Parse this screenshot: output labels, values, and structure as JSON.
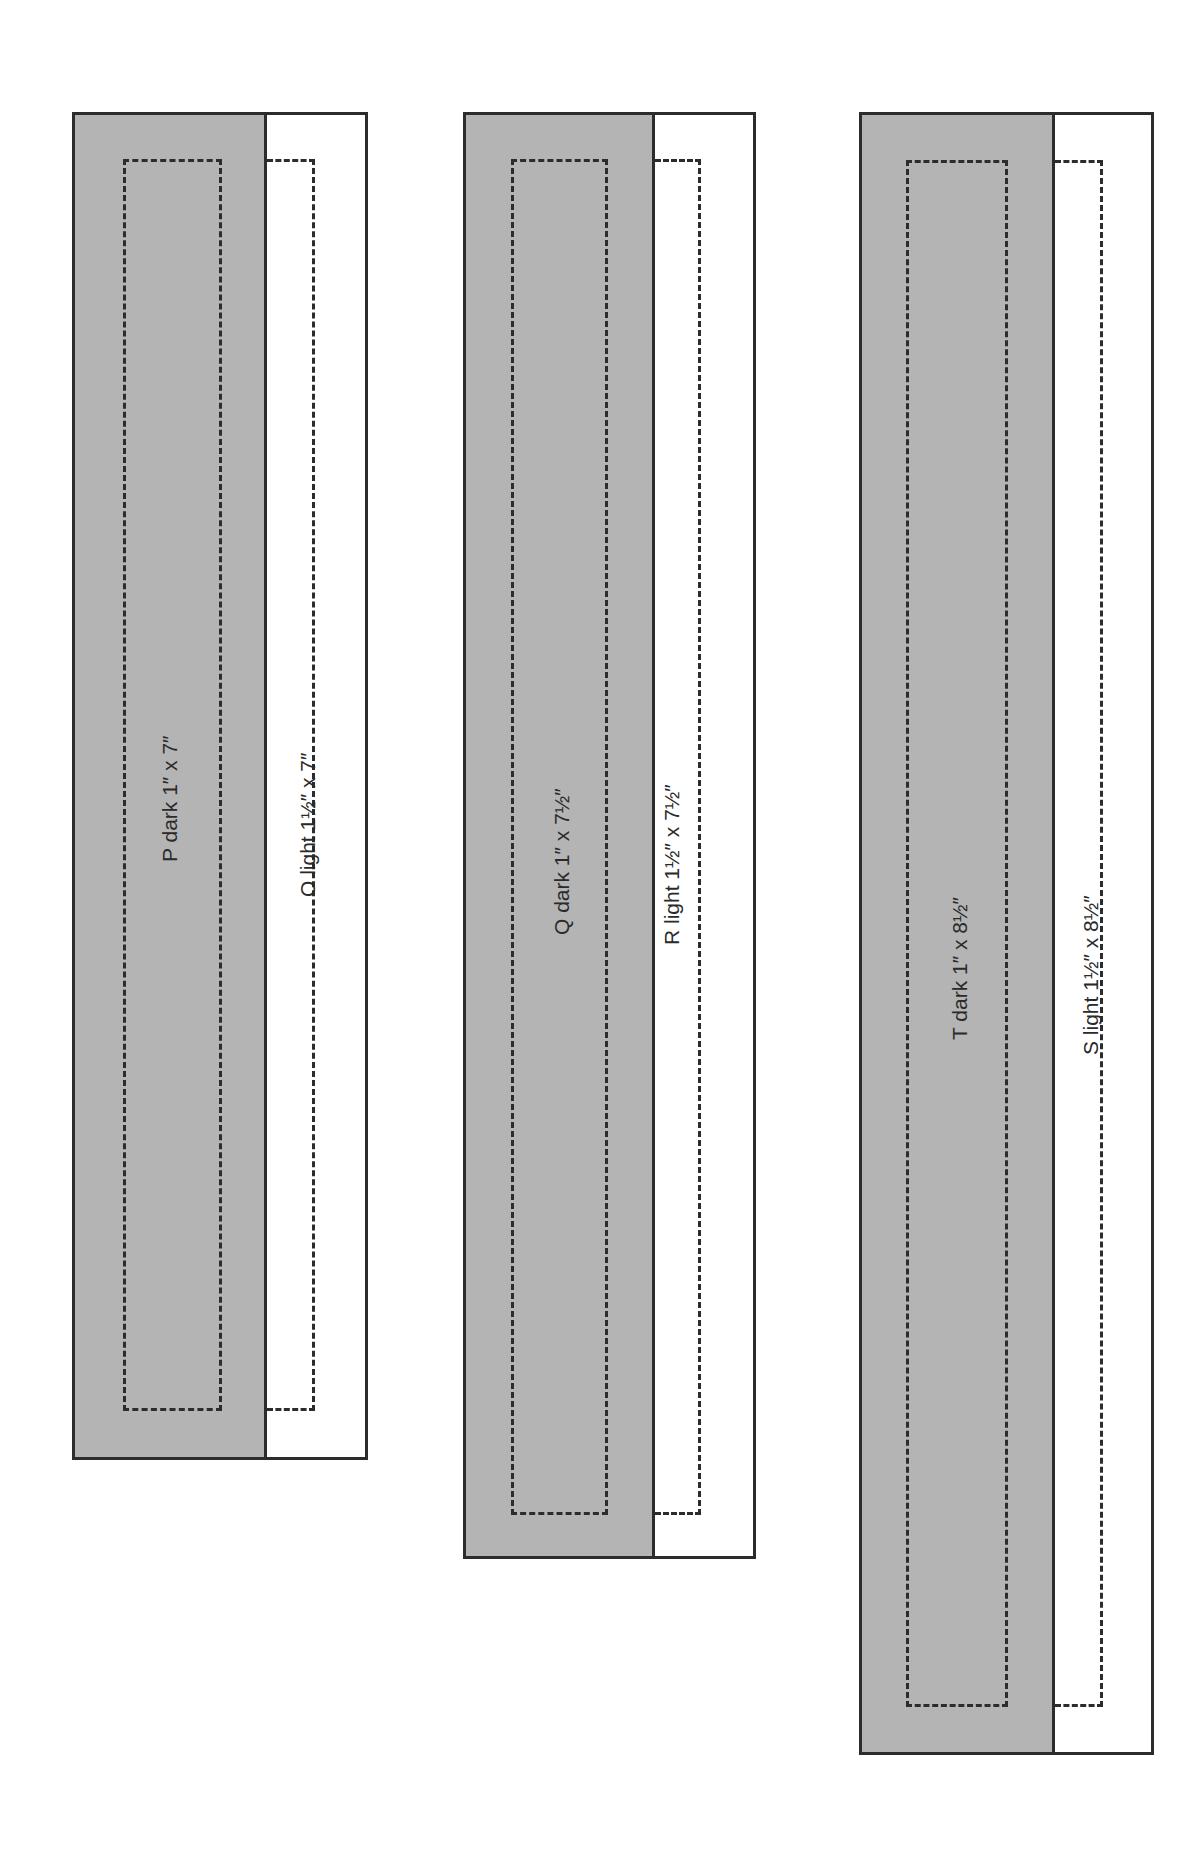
{
  "colors": {
    "dark_fabric": "#b4b4b4",
    "light_fabric": "#ffffff",
    "outline": "#2c2c2c"
  },
  "pieces": [
    {
      "id": "P",
      "tone": "dark",
      "label": "P dark 1″ x 7″"
    },
    {
      "id": "O",
      "tone": "light",
      "label": "O light 1½″ x 7″"
    },
    {
      "id": "Q",
      "tone": "dark",
      "label": "Q dark 1″ x 7½″"
    },
    {
      "id": "R",
      "tone": "light",
      "label": "R light 1½″ x 7½″"
    },
    {
      "id": "T",
      "tone": "dark",
      "label": "T dark 1″ x 8½″"
    },
    {
      "id": "S",
      "tone": "light",
      "label": "S light 1½″ x 8½″"
    }
  ]
}
